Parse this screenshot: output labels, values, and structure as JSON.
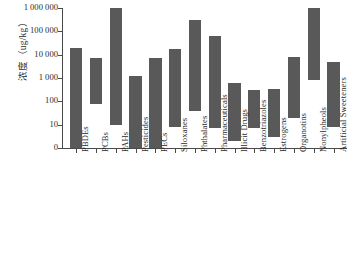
{
  "chart_data": {
    "type": "bar",
    "subtype": "floating-range-bar",
    "title": "",
    "xlabel": "",
    "ylabel": "浓度（ug/kg）",
    "yscale": "log-like (evenly spaced decade ticks with 0 baseline)",
    "ytick_labels": [
      "1 000 000",
      "100 000",
      "10 000",
      "1 000",
      "100",
      "10",
      "0"
    ],
    "ytick_values": [
      1000000,
      100000,
      10000,
      1000,
      100,
      10,
      0
    ],
    "ylim": [
      0,
      1000000
    ],
    "grid": false,
    "legend": false,
    "bar_color": "#595959",
    "axis_color": "#4a4a4a",
    "background": "#ffffff",
    "categories": [
      "PBDEs",
      "PCBs",
      "PAHs",
      "Pesticides",
      "PECs",
      "Siloxanes",
      "Phthalates",
      "Pharmaceuticals",
      "Illicit Drugs",
      "Benzotriazoles",
      "Estrogens",
      "Organotins",
      "Nonylpheols",
      "Artificial Sweeteners"
    ],
    "series": [
      {
        "name": "concentration range",
        "low": [
          0,
          80,
          10,
          0,
          0,
          8,
          40,
          7,
          2,
          7,
          3,
          20,
          800,
          8
        ],
        "high": [
          20000,
          7000,
          1000000,
          1200,
          7000,
          18000,
          300000,
          65000,
          600,
          320,
          330,
          8000,
          1000000,
          5000
        ]
      }
    ],
    "ranges": [
      {
        "category": "PBDEs",
        "low": 0,
        "high": 20000
      },
      {
        "category": "PCBs",
        "low": 80,
        "high": 7000
      },
      {
        "category": "PAHs",
        "low": 10,
        "high": 1000000
      },
      {
        "category": "Pesticides",
        "low": 0,
        "high": 1200
      },
      {
        "category": "PECs",
        "low": 0,
        "high": 7000
      },
      {
        "category": "Siloxanes",
        "low": 8,
        "high": 18000
      },
      {
        "category": "Phthalates",
        "low": 40,
        "high": 300000
      },
      {
        "category": "Pharmaceuticals",
        "low": 7,
        "high": 65000
      },
      {
        "category": "Illicit Drugs",
        "low": 2,
        "high": 600
      },
      {
        "category": "Benzotriazoles",
        "low": 7,
        "high": 320
      },
      {
        "category": "Estrogens",
        "low": 3,
        "high": 330
      },
      {
        "category": "Organotins",
        "low": 20,
        "high": 8000
      },
      {
        "category": "Nonylpheols",
        "low": 800,
        "high": 1000000
      },
      {
        "category": "Artificial Sweeteners",
        "low": 8,
        "high": 5000
      }
    ]
  }
}
